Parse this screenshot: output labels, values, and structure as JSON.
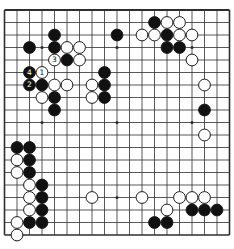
{
  "board": {
    "name": "go-board-diagram",
    "size": 19,
    "bg_color": "#ffffff",
    "line_color": "#2e2e2e",
    "black_stone_color": "#111111",
    "white_stone_color": "#ffffff",
    "stone_outline_color": "#1a1a1a",
    "hoshi_points": [
      [
        4,
        4
      ],
      [
        10,
        4
      ],
      [
        16,
        4
      ],
      [
        4,
        10
      ],
      [
        10,
        10
      ],
      [
        16,
        10
      ],
      [
        4,
        16
      ],
      [
        10,
        16
      ],
      [
        16,
        16
      ]
    ],
    "move_labels": [
      "1",
      "2",
      "3",
      "4"
    ],
    "stones": [
      {
        "col": 13,
        "row": 2,
        "color": "black"
      },
      {
        "col": 14,
        "row": 2,
        "color": "white"
      },
      {
        "col": 15,
        "row": 2,
        "color": "white"
      },
      {
        "col": 5,
        "row": 3,
        "color": "black"
      },
      {
        "col": 10,
        "row": 3,
        "color": "black"
      },
      {
        "col": 12,
        "row": 3,
        "color": "white"
      },
      {
        "col": 13,
        "row": 3,
        "color": "white"
      },
      {
        "col": 14,
        "row": 3,
        "color": "black"
      },
      {
        "col": 15,
        "row": 3,
        "color": "white"
      },
      {
        "col": 16,
        "row": 3,
        "color": "white"
      },
      {
        "col": 3,
        "row": 4,
        "color": "black"
      },
      {
        "col": 5,
        "row": 4,
        "color": "black"
      },
      {
        "col": 6,
        "row": 4,
        "color": "white"
      },
      {
        "col": 7,
        "row": 4,
        "color": "white"
      },
      {
        "col": 14,
        "row": 4,
        "color": "black"
      },
      {
        "col": 15,
        "row": 4,
        "color": "black"
      },
      {
        "col": 5,
        "row": 5,
        "color": "white",
        "label": "3"
      },
      {
        "col": 6,
        "row": 5,
        "color": "black"
      },
      {
        "col": 7,
        "row": 5,
        "color": "white"
      },
      {
        "col": 16,
        "row": 5,
        "color": "white"
      },
      {
        "col": 3,
        "row": 6,
        "color": "black",
        "label": "4"
      },
      {
        "col": 4,
        "row": 6,
        "color": "white",
        "label": "1"
      },
      {
        "col": 9,
        "row": 6,
        "color": "black"
      },
      {
        "col": 3,
        "row": 7,
        "color": "black",
        "label": "2"
      },
      {
        "col": 4,
        "row": 7,
        "color": "black"
      },
      {
        "col": 5,
        "row": 7,
        "color": "white"
      },
      {
        "col": 6,
        "row": 7,
        "color": "white"
      },
      {
        "col": 8,
        "row": 7,
        "color": "white"
      },
      {
        "col": 9,
        "row": 7,
        "color": "black"
      },
      {
        "col": 17,
        "row": 7,
        "color": "white"
      },
      {
        "col": 4,
        "row": 8,
        "color": "white"
      },
      {
        "col": 5,
        "row": 8,
        "color": "black"
      },
      {
        "col": 8,
        "row": 8,
        "color": "white"
      },
      {
        "col": 9,
        "row": 8,
        "color": "black"
      },
      {
        "col": 5,
        "row": 9,
        "color": "black"
      },
      {
        "col": 17,
        "row": 9,
        "color": "black"
      },
      {
        "col": 17,
        "row": 11,
        "color": "white"
      },
      {
        "col": 2,
        "row": 12,
        "color": "black"
      },
      {
        "col": 3,
        "row": 12,
        "color": "black"
      },
      {
        "col": 2,
        "row": 13,
        "color": "white"
      },
      {
        "col": 3,
        "row": 13,
        "color": "black"
      },
      {
        "col": 2,
        "row": 14,
        "color": "white"
      },
      {
        "col": 3,
        "row": 14,
        "color": "black"
      },
      {
        "col": 3,
        "row": 15,
        "color": "white"
      },
      {
        "col": 4,
        "row": 15,
        "color": "black"
      },
      {
        "col": 3,
        "row": 16,
        "color": "white"
      },
      {
        "col": 4,
        "row": 16,
        "color": "black"
      },
      {
        "col": 8,
        "row": 16,
        "color": "white"
      },
      {
        "col": 12,
        "row": 16,
        "color": "white"
      },
      {
        "col": 15,
        "row": 16,
        "color": "white"
      },
      {
        "col": 16,
        "row": 16,
        "color": "white"
      },
      {
        "col": 17,
        "row": 16,
        "color": "white"
      },
      {
        "col": 3,
        "row": 17,
        "color": "white"
      },
      {
        "col": 4,
        "row": 17,
        "color": "black"
      },
      {
        "col": 14,
        "row": 17,
        "color": "white"
      },
      {
        "col": 16,
        "row": 17,
        "color": "black"
      },
      {
        "col": 17,
        "row": 17,
        "color": "black"
      },
      {
        "col": 18,
        "row": 17,
        "color": "black"
      },
      {
        "col": 2,
        "row": 18,
        "color": "white"
      },
      {
        "col": 3,
        "row": 18,
        "color": "black"
      },
      {
        "col": 4,
        "row": 18,
        "color": "black"
      },
      {
        "col": 13,
        "row": 18,
        "color": "black"
      },
      {
        "col": 14,
        "row": 18,
        "color": "black"
      },
      {
        "col": 2,
        "row": 19,
        "color": "white"
      }
    ]
  }
}
